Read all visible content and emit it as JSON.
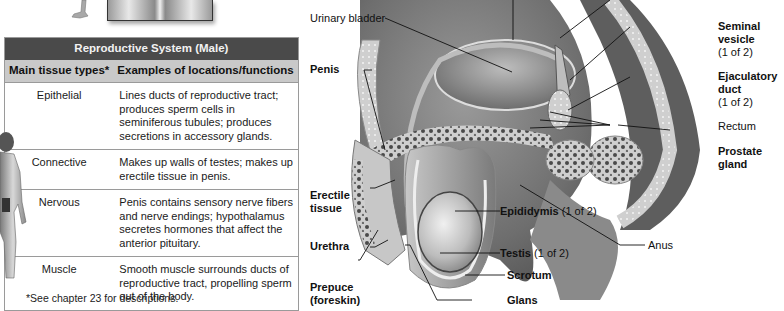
{
  "table": {
    "title": "Reproductive System (Male)",
    "headers": [
      "Main tissue types*",
      "Examples of locations/functions"
    ],
    "rows": [
      {
        "type": "Epithelial",
        "description": "Lines ducts of reproductive tract; produces sperm cells in seminiferous tubules; produces secretions in accessory glands."
      },
      {
        "type": "Connective",
        "description": "Makes up walls of testes; makes up erectile tissue in penis."
      },
      {
        "type": "Nervous",
        "description": "Penis contains sensory nerve fibers and nerve endings; hypothalamus secretes hormones that affect the anterior pituitary."
      },
      {
        "type": "Muscle",
        "description": "Smooth muscle surrounds ducts of reproductive tract, propelling sperm out of the body."
      }
    ],
    "footnote": "*See chapter 23 for descriptions."
  },
  "diagram": {
    "labels": {
      "urinary_bladder": "Urinary bladder",
      "penis": "Penis",
      "erectile_tissue_1": "Erectile",
      "erectile_tissue_2": "tissue",
      "urethra": "Urethra",
      "prepuce_1": "Prepuce",
      "prepuce_2": "(foreskin)",
      "seminal_vesicle_1": "Seminal",
      "seminal_vesicle_2": "vesicle",
      "seminal_vesicle_count": "(1 of 2)",
      "ejaculatory_duct_1": "Ejaculatory",
      "ejaculatory_duct_2": "duct",
      "ejaculatory_duct_count": "(1 of 2)",
      "rectum": "Rectum",
      "prostate_1": "Prostate",
      "prostate_2": "gland",
      "epididymis": "Epididymis",
      "epididymis_count": "(1 of 2)",
      "testis": "Testis",
      "testis_count": "(1 of 2)",
      "scrotum": "Scrotum",
      "glans": "Glans",
      "anus": "Anus"
    }
  }
}
